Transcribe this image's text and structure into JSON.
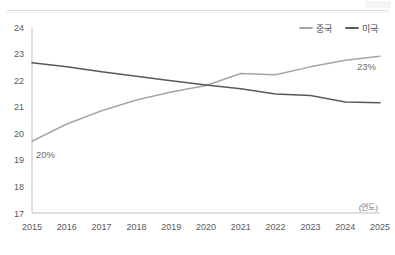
{
  "chart_data": {
    "type": "line",
    "title": "",
    "subtitle": "",
    "xlabel": "(연도)",
    "ylabel": "",
    "xlim": [
      2015,
      2025
    ],
    "ylim": [
      17,
      24
    ],
    "grid": false,
    "legend_position": "top-right",
    "x": [
      2015,
      2016,
      2017,
      2018,
      2019,
      2020,
      2021,
      2022,
      2023,
      2024,
      2025
    ],
    "x_tick_labels": [
      "2015",
      "2016",
      "2017",
      "2018",
      "2019",
      "2020",
      "2021",
      "2022",
      "2023",
      "2024",
      "2025"
    ],
    "y_tick_labels": [
      "24",
      "23",
      "22",
      "21",
      "20",
      "19",
      "18",
      "17"
    ],
    "y_ticks": [
      24,
      23,
      22,
      21,
      20,
      19,
      18,
      17
    ],
    "series": [
      {
        "name": "중국",
        "color": "#a6a6a6",
        "values": [
          19.7,
          20.35,
          20.85,
          21.25,
          21.55,
          21.8,
          22.25,
          22.2,
          22.5,
          22.75,
          22.9
        ]
      },
      {
        "name": "미국",
        "color": "#595959",
        "values": [
          22.65,
          22.5,
          22.32,
          22.15,
          21.98,
          21.82,
          21.68,
          21.48,
          21.42,
          21.18,
          21.15
        ]
      }
    ],
    "annotations": [
      {
        "text": "20%",
        "x": 2015,
        "y": 19.7,
        "color": "#6b6b6b"
      },
      {
        "text": "23%",
        "x": 2025,
        "y": 22.9,
        "color": "#6b6b6b"
      }
    ]
  },
  "legend": {
    "items": [
      {
        "label": "중국",
        "color": "#a6a6a6"
      },
      {
        "label": "미국",
        "color": "#595959"
      }
    ]
  },
  "axis": {
    "x_unit_label": "(연도)"
  }
}
